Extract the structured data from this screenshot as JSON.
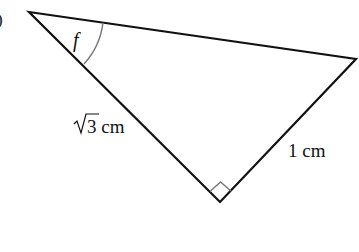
{
  "diagram": {
    "type": "right-triangle",
    "part_label": ")",
    "vertices": {
      "top_left": [
        29,
        12
      ],
      "right": [
        356,
        59
      ],
      "bottom": [
        220,
        202
      ]
    },
    "angle_label": "f",
    "sides": {
      "left_side_label": "√3 cm",
      "left_side_radical": "√",
      "left_side_value": "3 cm",
      "right_side_label": "1 cm"
    },
    "right_angle_marker": true,
    "colors": {
      "line": "#111111",
      "arc": "#777777",
      "marker": "#777777"
    }
  }
}
